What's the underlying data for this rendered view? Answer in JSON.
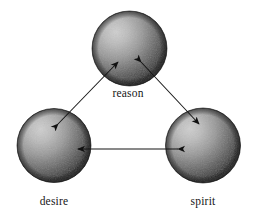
{
  "figure": {
    "background_color": "#ffffff",
    "line_color": "#1a1a1a",
    "text_color": "#161616"
  },
  "nodes": [
    {
      "id": "reason",
      "label": "reason",
      "shape": "sphere",
      "cx": 129.5,
      "cy": 48.5,
      "r": 37.5,
      "label_x": 128,
      "label_y": 88,
      "fill_light": "#c2c2c2",
      "fill_mid": "#8a8a8a",
      "fill_dark": "#2e2e2e",
      "highlight_x": "32%",
      "highlight_y": "28%"
    },
    {
      "id": "desire",
      "label": "desire",
      "shape": "sphere",
      "cx": 54.0,
      "cy": 145.5,
      "r": 37.0,
      "label_x": 54,
      "label_y": 196,
      "fill_light": "#c2c2c2",
      "fill_mid": "#8a8a8a",
      "fill_dark": "#2e2e2e",
      "highlight_x": "32%",
      "highlight_y": "28%"
    },
    {
      "id": "spirit",
      "label": "spirit",
      "shape": "sphere",
      "cx": 203.0,
      "cy": 145.5,
      "r": 37.5,
      "label_x": 203,
      "label_y": 196,
      "fill_light": "#c2c2c2",
      "fill_mid": "#8a8a8a",
      "fill_dark": "#2e2e2e",
      "highlight_x": "32%",
      "highlight_y": "28%"
    }
  ],
  "edges": [
    {
      "id": "desire-reason",
      "from": "desire",
      "to": "reason",
      "style": "double-headed-arrow",
      "x1": 58.0,
      "y1": 124.0,
      "x2": 118.0,
      "y2": 62.0
    },
    {
      "id": "reason-spirit",
      "from": "reason",
      "to": "spirit",
      "style": "double-headed-arrow",
      "x1": 141.0,
      "y1": 62.0,
      "x2": 199.0,
      "y2": 124.0
    },
    {
      "id": "desire-spirit",
      "from": "spirit",
      "to": "desire",
      "style": "double-headed-arrow",
      "x1": 178.0,
      "y1": 149.0,
      "x2": 78.0,
      "y2": 149.0
    }
  ]
}
